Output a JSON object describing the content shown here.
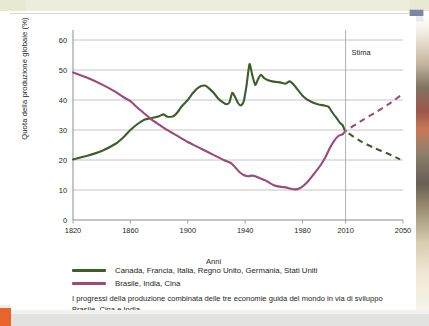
{
  "figure": {
    "ylabel": "Quota della produzione globale (%)",
    "xlabel": "Anni",
    "annotation": "Stima",
    "caption": "I progressi della produzione combinata delle tre economie guida del mondo in via di sviluppo Brasile, Cina e India.",
    "legend": [
      {
        "label": "Canada, Francia, Italia, Regno Unito, Germania, Stati Uniti",
        "color": "#3c5e2a",
        "key": "green"
      },
      {
        "label": "Brasile, India, Cina",
        "color": "#9c4a78",
        "key": "purple"
      }
    ]
  },
  "colors": {
    "green": "#3c5e2a",
    "purple": "#9c4a78",
    "grid": "#b5b5b5",
    "axis": "#8c8c8c",
    "text": "#231f20",
    "page_band": "#e8e9d2",
    "orange_tab": "#e8642a"
  },
  "chart_data": {
    "type": "line",
    "title": "",
    "subtitle": "",
    "xlabel": "Anni",
    "ylabel": "Quota della produzione globale (%)",
    "xlim": [
      1820,
      2050
    ],
    "ylim": [
      0,
      62
    ],
    "yticks": [
      0,
      10,
      20,
      30,
      40,
      50,
      60
    ],
    "xticks": [
      1820,
      1860,
      1900,
      1940,
      1980,
      2010,
      2050
    ],
    "grid": "horizontal",
    "legend_position": "below-plot",
    "annotations": [
      {
        "text": "Stima",
        "x": 2010,
        "y": 55,
        "note": "vertical divider at 2010 separating history from projection"
      }
    ],
    "series": [
      {
        "name": "Canada, Francia, Italia, Regno Unito, Germania, Stati Uniti",
        "color": "#3c5e2a",
        "style": "solid",
        "points": [
          [
            1820,
            20.2
          ],
          [
            1830,
            21.4
          ],
          [
            1840,
            23.0
          ],
          [
            1850,
            25.5
          ],
          [
            1855,
            27.5
          ],
          [
            1860,
            30.0
          ],
          [
            1865,
            32.0
          ],
          [
            1870,
            33.5
          ],
          [
            1875,
            34.0
          ],
          [
            1880,
            34.6
          ],
          [
            1883,
            35.2
          ],
          [
            1886,
            34.4
          ],
          [
            1890,
            34.6
          ],
          [
            1893,
            36.0
          ],
          [
            1896,
            38.0
          ],
          [
            1900,
            40.0
          ],
          [
            1903,
            42.0
          ],
          [
            1906,
            43.6
          ],
          [
            1909,
            44.6
          ],
          [
            1912,
            44.8
          ],
          [
            1915,
            43.8
          ],
          [
            1918,
            42.4
          ],
          [
            1921,
            40.6
          ],
          [
            1924,
            39.4
          ],
          [
            1927,
            38.6
          ],
          [
            1929,
            39.2
          ],
          [
            1931,
            42.4
          ],
          [
            1933,
            41.0
          ],
          [
            1935,
            39.0
          ],
          [
            1937,
            38.2
          ],
          [
            1939,
            39.6
          ],
          [
            1941,
            45.0
          ],
          [
            1943,
            52.0
          ],
          [
            1945,
            48.2
          ],
          [
            1947,
            45.0
          ],
          [
            1949,
            47.0
          ],
          [
            1951,
            48.4
          ],
          [
            1953,
            47.4
          ],
          [
            1956,
            46.6
          ],
          [
            1959,
            46.2
          ],
          [
            1962,
            46.0
          ],
          [
            1965,
            45.8
          ],
          [
            1968,
            45.4
          ],
          [
            1971,
            46.2
          ],
          [
            1974,
            45.0
          ],
          [
            1977,
            43.2
          ],
          [
            1980,
            41.4
          ],
          [
            1983,
            40.2
          ],
          [
            1986,
            39.4
          ],
          [
            1989,
            38.8
          ],
          [
            1992,
            38.4
          ],
          [
            1995,
            38.2
          ],
          [
            1998,
            37.8
          ],
          [
            2000,
            36.4
          ],
          [
            2002,
            35.0
          ],
          [
            2004,
            33.8
          ],
          [
            2006,
            32.4
          ],
          [
            2008,
            31.6
          ]
        ],
        "projection_style": "dashed",
        "projection_points": [
          [
            2008,
            31.6
          ],
          [
            2010,
            29.6
          ],
          [
            2020,
            26.4
          ],
          [
            2030,
            24.0
          ],
          [
            2040,
            22.0
          ],
          [
            2048,
            20.2
          ]
        ]
      },
      {
        "name": "Brasile, India, Cina",
        "color": "#9c4a78",
        "style": "solid",
        "points": [
          [
            1820,
            49.2
          ],
          [
            1830,
            47.4
          ],
          [
            1840,
            45.2
          ],
          [
            1850,
            42.6
          ],
          [
            1855,
            41.0
          ],
          [
            1860,
            39.6
          ],
          [
            1865,
            37.4
          ],
          [
            1870,
            35.4
          ],
          [
            1875,
            33.4
          ],
          [
            1880,
            31.8
          ],
          [
            1885,
            30.2
          ],
          [
            1890,
            28.8
          ],
          [
            1895,
            27.4
          ],
          [
            1900,
            26.0
          ],
          [
            1905,
            24.8
          ],
          [
            1910,
            23.6
          ],
          [
            1915,
            22.4
          ],
          [
            1920,
            21.2
          ],
          [
            1925,
            20.0
          ],
          [
            1930,
            19.0
          ],
          [
            1933,
            17.6
          ],
          [
            1936,
            16.0
          ],
          [
            1939,
            15.0
          ],
          [
            1942,
            14.6
          ],
          [
            1945,
            14.8
          ],
          [
            1948,
            14.4
          ],
          [
            1951,
            13.8
          ],
          [
            1954,
            13.2
          ],
          [
            1957,
            12.4
          ],
          [
            1960,
            11.6
          ],
          [
            1963,
            11.2
          ],
          [
            1966,
            11.0
          ],
          [
            1969,
            10.8
          ],
          [
            1972,
            10.4
          ],
          [
            1975,
            10.2
          ],
          [
            1978,
            10.6
          ],
          [
            1981,
            11.6
          ],
          [
            1984,
            13.0
          ],
          [
            1987,
            14.8
          ],
          [
            1990,
            16.6
          ],
          [
            1993,
            18.6
          ],
          [
            1996,
            21.0
          ],
          [
            1999,
            24.0
          ],
          [
            2002,
            26.4
          ],
          [
            2005,
            28.0
          ],
          [
            2008,
            28.6
          ]
        ],
        "projection_style": "dashed",
        "projection_points": [
          [
            2008,
            28.6
          ],
          [
            2010,
            29.6
          ],
          [
            2020,
            32.8
          ],
          [
            2030,
            35.6
          ],
          [
            2040,
            38.6
          ],
          [
            2048,
            41.4
          ]
        ]
      }
    ]
  }
}
